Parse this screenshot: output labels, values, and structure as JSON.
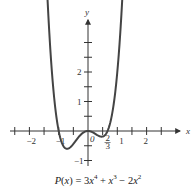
{
  "chart_data": {
    "type": "line",
    "function": "3x^4 + x^3 - 2x^2",
    "xlabel": "x",
    "ylabel": "y",
    "x_ticks": [
      -2.5,
      -2,
      -1.5,
      -1,
      -0.5,
      0,
      0.5,
      1,
      1.5,
      2,
      2.5
    ],
    "x_tick_labels": [
      {
        "value": -2,
        "label": "-2"
      },
      {
        "value": -1,
        "label": "-1"
      },
      {
        "value": 0,
        "label": "0"
      },
      {
        "value": 0.6667,
        "label": "2/3"
      },
      {
        "value": 1,
        "label": "1"
      },
      {
        "value": 2,
        "label": "2"
      }
    ],
    "y_ticks": [
      -1,
      -0.5,
      0.5,
      1,
      1.5,
      2,
      2.5,
      3
    ],
    "y_tick_labels": [
      {
        "value": -1,
        "label": "-1"
      },
      {
        "value": 1,
        "label": "1"
      },
      {
        "value": 2,
        "label": "2"
      }
    ],
    "xlim": [
      -2.7,
      2.7
    ],
    "ylim": [
      -1.1,
      3.7
    ],
    "zeros": [
      -1,
      0,
      0.6667
    ],
    "grid": false,
    "legend": "none",
    "arrows": "curve ends at both sides, axes positive directions"
  },
  "labels": {
    "x_axis": "x",
    "y_axis": "y",
    "origin": "0",
    "frac_num": "2",
    "frac_den": "3",
    "caption_prefix": "P(x) = 3x",
    "caption_exp1": "4",
    "caption_mid": " + x",
    "caption_exp2": "3",
    "caption_mid2": " − 2x",
    "caption_exp3": "2"
  }
}
